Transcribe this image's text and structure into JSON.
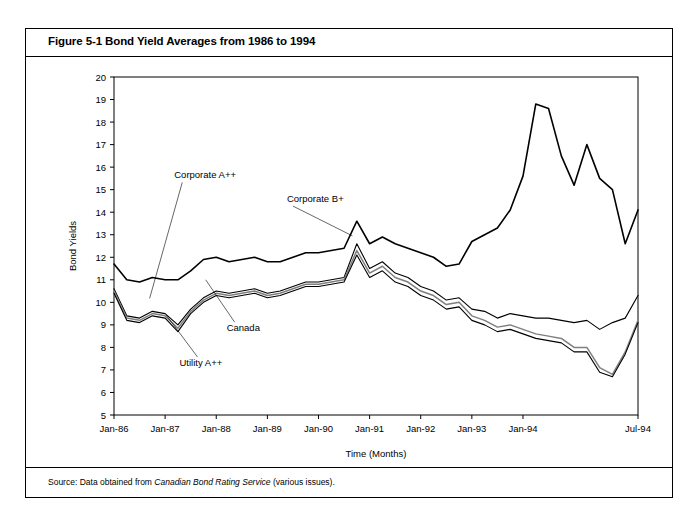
{
  "figure": {
    "title": "Figure 5-1 Bond Yield Averages from 1986 to 1994",
    "title_number": "Figure 5-1",
    "title_text": "Bond Yield Averages from 1986 to 1994",
    "source_prefix": "Source: Data obtained from ",
    "source_italic": "Canadian Bond Rating Service",
    "source_suffix": " (various issues)."
  },
  "chart_data": {
    "type": "line",
    "title": "Bond Yield Averages from 1986 to 1994",
    "xlabel": "Time (Months)",
    "ylabel": "Bond Yields",
    "ylim": [
      5,
      20
    ],
    "yticks": [
      5,
      6,
      7,
      8,
      9,
      10,
      11,
      12,
      13,
      14,
      15,
      16,
      17,
      18,
      19,
      20
    ],
    "xticks": [
      "Jan-86",
      "Jan-87",
      "Jan-88",
      "Jan-89",
      "Jan-90",
      "Jan-91",
      "Jan-92",
      "Jan-93",
      "Jan-94",
      "Jul-94"
    ],
    "grid": false,
    "legend_position": "inline-annotations",
    "x_start": "Jan-86",
    "x_end": "Jul-94",
    "x_step_months": 3,
    "annotations": [
      {
        "label": "Corporate A++",
        "x": 0.115,
        "y": 0.3
      },
      {
        "label": "Corporate B+",
        "x": 0.33,
        "y": 0.37
      },
      {
        "label": "Canada",
        "x": 0.215,
        "y": 0.752
      },
      {
        "label": "Utility A++",
        "x": 0.125,
        "y": 0.855
      }
    ],
    "series": [
      {
        "name": "Corporate B+",
        "color": "#000000",
        "width": 1.6,
        "values": [
          11.7,
          11.0,
          10.9,
          11.1,
          11.0,
          11.0,
          11.4,
          11.9,
          12.0,
          11.8,
          11.9,
          12.0,
          11.8,
          11.8,
          12.0,
          12.2,
          12.2,
          12.3,
          12.4,
          13.6,
          12.6,
          12.9,
          12.6,
          12.4,
          12.2,
          12.0,
          11.6,
          11.7,
          12.7,
          13.0,
          13.3,
          14.1,
          15.6,
          18.8,
          18.6,
          16.5,
          15.2,
          17.0,
          15.5,
          15.0,
          12.6,
          14.1
        ]
      },
      {
        "name": "Corporate A++",
        "color": "#000000",
        "width": 1.1,
        "values": [
          10.6,
          9.4,
          9.3,
          9.6,
          9.5,
          9.0,
          9.7,
          10.2,
          10.5,
          10.4,
          10.5,
          10.6,
          10.4,
          10.5,
          10.7,
          10.9,
          10.9,
          11.0,
          11.1,
          12.6,
          11.5,
          11.8,
          11.3,
          11.1,
          10.7,
          10.5,
          10.1,
          10.2,
          9.7,
          9.6,
          9.3,
          9.5,
          9.4,
          9.3,
          9.3,
          9.2,
          9.1,
          9.2,
          8.8,
          9.1,
          9.3,
          10.3
        ]
      },
      {
        "name": "Utility A++",
        "color": "#7f7f7f",
        "width": 1.5,
        "values": [
          10.5,
          9.3,
          9.2,
          9.5,
          9.4,
          8.85,
          9.6,
          10.1,
          10.4,
          10.3,
          10.4,
          10.5,
          10.3,
          10.4,
          10.6,
          10.8,
          10.8,
          10.9,
          11.0,
          12.3,
          11.3,
          11.6,
          11.1,
          10.9,
          10.5,
          10.3,
          9.9,
          10.0,
          9.4,
          9.2,
          8.9,
          9.0,
          8.8,
          8.6,
          8.5,
          8.4,
          8.0,
          8.0,
          7.1,
          6.8,
          7.8,
          9.2
        ]
      },
      {
        "name": "Canada",
        "color": "#000000",
        "width": 1.1,
        "values": [
          10.4,
          9.2,
          9.1,
          9.4,
          9.3,
          8.7,
          9.5,
          10.0,
          10.3,
          10.2,
          10.3,
          10.4,
          10.2,
          10.3,
          10.5,
          10.7,
          10.7,
          10.8,
          10.9,
          12.1,
          11.1,
          11.4,
          10.9,
          10.7,
          10.3,
          10.1,
          9.7,
          9.8,
          9.2,
          9.0,
          8.7,
          8.8,
          8.6,
          8.4,
          8.3,
          8.2,
          7.8,
          7.8,
          6.9,
          6.7,
          7.7,
          9.1
        ]
      }
    ]
  }
}
